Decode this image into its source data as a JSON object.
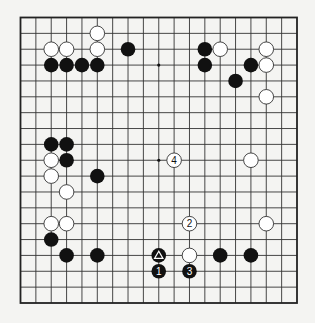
{
  "diagram": {
    "type": "go-board",
    "size": 19,
    "colors": {
      "background": "#f4f4f2",
      "line": "#333333",
      "black": "#111111",
      "white": "#ffffff"
    },
    "star_points": [
      [
        3,
        3
      ],
      [
        9,
        3
      ],
      [
        15,
        3
      ],
      [
        3,
        9
      ],
      [
        9,
        9
      ],
      [
        15,
        9
      ],
      [
        3,
        15
      ],
      [
        9,
        15
      ],
      [
        15,
        15
      ]
    ],
    "black_stones": [
      [
        7,
        2
      ],
      [
        2,
        3
      ],
      [
        3,
        3
      ],
      [
        4,
        3
      ],
      [
        5,
        3
      ],
      [
        12,
        2
      ],
      [
        12,
        3
      ],
      [
        15,
        3
      ],
      [
        14,
        4
      ],
      [
        2,
        8
      ],
      [
        3,
        8
      ],
      [
        3,
        9
      ],
      [
        5,
        10
      ],
      [
        2,
        14
      ],
      [
        3,
        15
      ],
      [
        5,
        15
      ],
      [
        13,
        15
      ],
      [
        15,
        15
      ]
    ],
    "white_stones": [
      [
        5,
        1
      ],
      [
        2,
        2
      ],
      [
        3,
        2
      ],
      [
        5,
        2
      ],
      [
        13,
        2
      ],
      [
        16,
        2
      ],
      [
        16,
        3
      ],
      [
        16,
        5
      ],
      [
        2,
        9
      ],
      [
        2,
        10
      ],
      [
        3,
        11
      ],
      [
        15,
        9
      ],
      [
        2,
        13
      ],
      [
        3,
        13
      ],
      [
        16,
        13
      ],
      [
        11,
        15
      ]
    ],
    "marked_stones": [
      {
        "col": 9,
        "row": 15,
        "color": "black",
        "mark": "triangle",
        "label": "△"
      }
    ],
    "numbered_moves": [
      {
        "col": 9,
        "row": 16,
        "color": "black",
        "label": "1"
      },
      {
        "col": 11,
        "row": 13,
        "color": "white",
        "label": "2"
      },
      {
        "col": 11,
        "row": 16,
        "color": "black",
        "label": "3"
      },
      {
        "col": 10,
        "row": 9,
        "color": "white",
        "label": "4"
      }
    ]
  }
}
